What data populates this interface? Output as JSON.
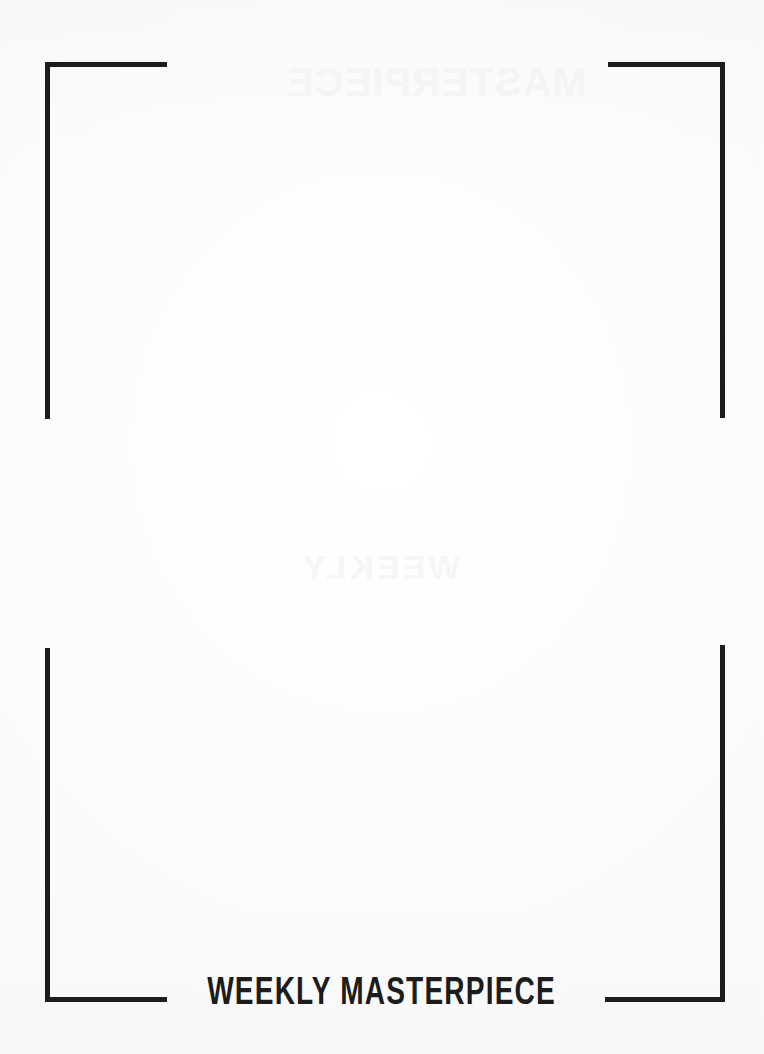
{
  "page": {
    "width": 764,
    "height": 1054,
    "background_color": "#fdfdfd",
    "ink_color": "#1c1c1c"
  },
  "frame": {
    "style": "corner-brackets",
    "stroke_color": "#1c1c1c",
    "stroke_width_px": 5,
    "corners": [
      {
        "id": "top-left",
        "label": "top-left-corner-bracket"
      },
      {
        "id": "top-right",
        "label": "top-right-corner-bracket"
      },
      {
        "id": "bottom-left",
        "label": "bottom-left-corner-bracket"
      },
      {
        "id": "bottom-right",
        "label": "bottom-right-corner-bracket"
      }
    ]
  },
  "caption": {
    "text": "WEEKLY MASTERPIECE",
    "color": "#1c1c1c",
    "alignment": "center"
  },
  "ghosting": {
    "top_artifact": "MASTERPIECE",
    "middle_artifact": "WEEKLY"
  }
}
